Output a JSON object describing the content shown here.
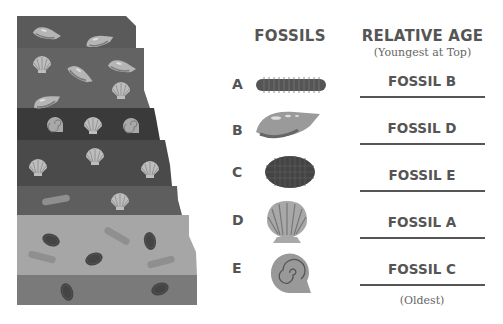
{
  "headers": {
    "fossils": "FOSSILS",
    "relative_age": "RELATIVE AGE",
    "relative_age_sub": "(Youngest at Top)",
    "oldest_note": "(Oldest)"
  },
  "fossils": [
    {
      "letter": "A",
      "type": "segmented-worm"
    },
    {
      "letter": "B",
      "type": "spiral-cone-shell"
    },
    {
      "letter": "C",
      "type": "trilobite"
    },
    {
      "letter": "D",
      "type": "scallop-shell"
    },
    {
      "letter": "E",
      "type": "ammonite"
    }
  ],
  "answers": [
    {
      "label": "FOSSIL B"
    },
    {
      "label": "FOSSIL D"
    },
    {
      "label": "FOSSIL E"
    },
    {
      "label": "FOSSIL A"
    },
    {
      "label": "FOSSIL C"
    }
  ],
  "strata": {
    "layers": [
      {
        "name": "layer-1",
        "color": "#5a5a5a",
        "fossils": [
          "cone-shell",
          "cone-shell"
        ]
      },
      {
        "name": "layer-2",
        "color": "#636363",
        "fossils": [
          "scallop",
          "cone-shell",
          "cone-shell",
          "scallop",
          "cone-shell"
        ]
      },
      {
        "name": "layer-3",
        "color": "#3a3a3a",
        "fossils": [
          "ammonite",
          "scallop",
          "ammonite"
        ]
      },
      {
        "name": "layer-4",
        "color": "#4a4a4a",
        "fossils": [
          "scallop",
          "scallop",
          "scallop"
        ]
      },
      {
        "name": "layer-5",
        "color": "#5e5e5e",
        "fossils": [
          "worm",
          "scallop"
        ]
      },
      {
        "name": "layer-6",
        "color": "#a6a6a6",
        "fossils": [
          "trilobite",
          "worm",
          "trilobite",
          "worm",
          "trilobite",
          "worm"
        ]
      },
      {
        "name": "layer-7",
        "color": "#7a7a7a",
        "fossils": [
          "trilobite",
          "trilobite"
        ]
      }
    ]
  }
}
